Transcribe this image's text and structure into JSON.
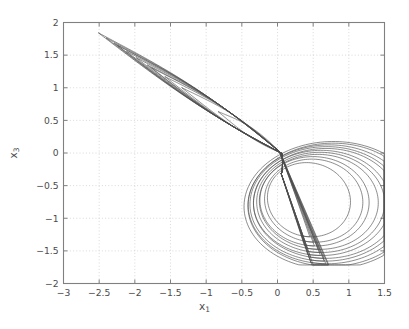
{
  "chart_data": {
    "type": "line",
    "title": "",
    "subtitle": "",
    "xlabel": "x_1",
    "xlabel_base": "x",
    "xlabel_sub": "1",
    "ylabel": "x_3",
    "ylabel_base": "x",
    "ylabel_sub": "3",
    "xlim": [
      -3,
      1.5
    ],
    "ylim": [
      -2,
      2
    ],
    "xticks": [
      -3,
      -2.5,
      -2,
      -1.5,
      -1,
      -0.5,
      0,
      0.5,
      1,
      1.5
    ],
    "xticklabels": [
      "-3",
      "-2.5",
      "-2",
      "-1.5",
      "-1",
      "-0.5",
      "0",
      "0.5",
      "1",
      "1.5"
    ],
    "yticks": [
      -2,
      -1.5,
      -1,
      -0.5,
      0,
      0.5,
      1,
      1.5,
      2
    ],
    "yticklabels": [
      "-2",
      "-1.5",
      "-1",
      "-0.5",
      "0",
      "0.5",
      "1",
      "1.5",
      "2"
    ],
    "grid": true,
    "grid_style": "dotted",
    "grid_color": "#c8c8c8",
    "legend": null,
    "legend_position": "none",
    "line_color": "#4d4d4d",
    "line_width": 0.7,
    "axes_color": "#808080",
    "background": "#ffffff",
    "series": [
      {
        "name": "trajectory",
        "attractor": {
          "x_tip": [
            -2.55,
            1.87
          ],
          "x_right_max": 1.5,
          "y_bottom_min": -1.7,
          "y_right_lobe_top": 0.25,
          "crossing_point": [
            0.05,
            0.0
          ],
          "band_slope": -0.95,
          "loop_count": 11
        }
      }
    ]
  }
}
